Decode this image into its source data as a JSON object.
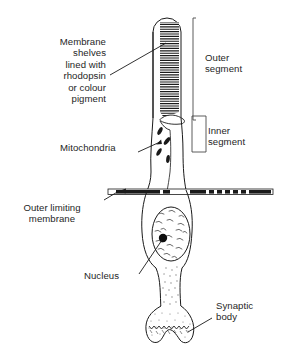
{
  "figure": {
    "background_color": "#ffffff",
    "ink_color": "#1a1a1a",
    "text_color": "#262626"
  },
  "labels": {
    "membrane_shelves": "Membrane\nshelves\nlined with\nrhodopsin\nor colour\npigment",
    "outer_segment": "Outer\nsegment",
    "inner_segment": "Inner\nsegment",
    "mitochondria": "Mitochondria",
    "outer_limiting_membrane": "Outer limiting\nmembrane",
    "nucleus": "Nucleus",
    "synaptic_body": "Synaptic\nbody"
  },
  "structures": [
    {
      "name": "outer-segment",
      "description": "Elongated dome-topped cylinder filled with dense stacked membrane discs"
    },
    {
      "name": "membrane-disc-stack",
      "description": "Horizontal dark lamellae tapering toward the base"
    },
    {
      "name": "connecting-cilium",
      "description": "Narrow neck joining outer and inner segments"
    },
    {
      "name": "inner-segment",
      "description": "Tubular region containing mitochondria"
    },
    {
      "name": "mitochondria",
      "description": "Four small dark slanted rod-shaped organelles"
    },
    {
      "name": "outer-limiting-membrane",
      "description": "Horizontal banded bar crossing the cell, black and white segments"
    },
    {
      "name": "nucleus",
      "description": "Oval body with stippled chromatin texture and a solid dark nucleolus"
    },
    {
      "name": "nucleolus",
      "description": "Solid black dot inside the nucleus"
    },
    {
      "name": "axon",
      "description": "Narrow waisted stippled fibre below the nucleus"
    },
    {
      "name": "synaptic-body",
      "description": "Flared foot with scalloped notched lower edge"
    },
    {
      "name": "outer-segment-bracket",
      "description": "Tall vertical bracket on the right marking the outer segment extent"
    },
    {
      "name": "inner-segment-bracket",
      "description": "Rectangular bracket on the right marking the inner segment extent"
    }
  ]
}
